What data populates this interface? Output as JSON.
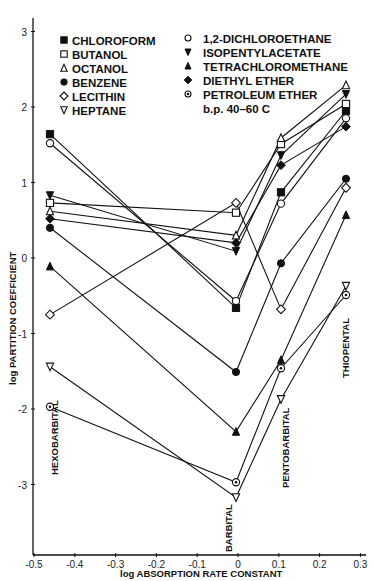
{
  "chart_data": {
    "type": "line",
    "title": "",
    "xlabel": "log ABSORPTION RATE CONSTANT",
    "ylabel": "log PARTITION COEFFICIENT",
    "xlim": [
      -0.53,
      0.31
    ],
    "ylim": [
      -3.9,
      3.3
    ],
    "x_ticks": [
      "-0.5",
      "-0.4",
      "-0.3",
      "-0.2",
      "-0.1",
      "0",
      "0.1",
      "0.2",
      "0.3"
    ],
    "y_ticks": [
      "3",
      "2",
      "1",
      "0",
      "-1",
      "-2",
      "-3"
    ],
    "grid": false,
    "legend_position": "upper-left",
    "categories": [
      "HEXOBARBITAL",
      "BARBITAL",
      "PENTOBARBITAL",
      "THIOPENTAL"
    ],
    "x": [
      -0.46,
      0.0,
      0.105,
      0.265
    ],
    "series": [
      {
        "name": "CHLOROFORM",
        "marker": "filled-square",
        "values": [
          1.64,
          -0.66,
          0.87,
          1.95
        ]
      },
      {
        "name": "BUTANOL",
        "marker": "open-square",
        "values": [
          0.73,
          0.6,
          1.51,
          2.04
        ]
      },
      {
        "name": "OCTANOL",
        "marker": "open-triangle-up",
        "values": [
          0.62,
          0.3,
          1.59,
          2.29
        ]
      },
      {
        "name": "BENZENE",
        "marker": "filled-circle",
        "values": [
          0.4,
          -1.51,
          -0.07,
          1.05
        ]
      },
      {
        "name": "LECITHIN",
        "marker": "open-diamond",
        "values": [
          -0.75,
          0.73,
          -0.68,
          0.93
        ]
      },
      {
        "name": "HEPTANE",
        "marker": "open-triangle-down",
        "values": [
          -1.44,
          -3.17,
          -1.87,
          -0.37
        ]
      },
      {
        "name": "1,2-DICHLOROETHANE",
        "marker": "open-circle",
        "values": [
          1.52,
          -0.57,
          0.72,
          1.85
        ]
      },
      {
        "name": "ISOPENTYLACETATE",
        "marker": "filled-triangle-down",
        "values": [
          0.83,
          0.09,
          1.36,
          2.17
        ]
      },
      {
        "name": "TETRACHLOROMETHANE",
        "marker": "filled-triangle-up",
        "values": [
          -0.11,
          -2.3,
          -1.35,
          0.57
        ]
      },
      {
        "name": "DIETHYL ETHER",
        "marker": "filled-diamond",
        "values": [
          0.52,
          0.2,
          1.23,
          1.74
        ]
      },
      {
        "name": "PETROLEUM ETHER b.p. 40-60 C",
        "marker": "dotted-circle",
        "values": [
          -1.97,
          -2.97,
          -1.46,
          -0.49
        ]
      }
    ],
    "annotations": [
      "HEXOBARBITAL",
      "BARBITAL",
      "PENTOBARBITAL",
      "THIOPENTAL"
    ]
  },
  "legend": {
    "left": [
      "CHLOROFORM",
      "BUTANOL",
      "OCTANOL",
      "BENZENE",
      "LECITHIN",
      "HEPTANE"
    ],
    "right": [
      "1,2-DICHLOROETHANE",
      "ISOPENTYLACETATE",
      "TETRACHLOROMETHANE",
      "DIETHYL ETHER",
      "PETROLEUM ETHER",
      "b.p. 40–60 C"
    ]
  },
  "axes": {
    "xlabel": "log ABSORPTION RATE CONSTANT",
    "ylabel": "log PARTITION COEFFICIENT"
  },
  "drug_labels": {
    "hexobarbital": "HEXOBARBITAL",
    "barbital": "BARBITAL",
    "pentobarbital": "PENTOBARBITAL",
    "thiopental": "THIOPENTAL"
  }
}
